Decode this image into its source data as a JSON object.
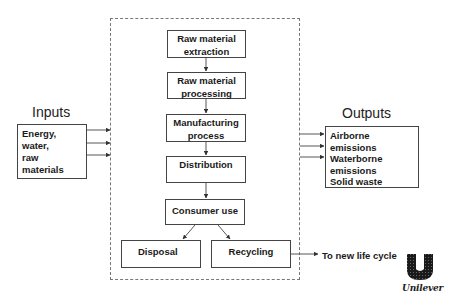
{
  "diagram": {
    "inputs": {
      "heading": "Inputs",
      "items": [
        "Energy,",
        "water,",
        "raw",
        "materials"
      ]
    },
    "outputs": {
      "heading": "Outputs",
      "items": [
        "Airborne",
        "emissions",
        "Waterborne",
        "emissions",
        "Solid waste"
      ]
    },
    "stages": [
      {
        "line1": "Raw material",
        "line2": "extraction"
      },
      {
        "line1": "Raw material",
        "line2": "processing"
      },
      {
        "line1": "Manufacturing",
        "line2": "process"
      },
      {
        "line1": "Distribution",
        "line2": ""
      },
      {
        "line1": "Consumer use",
        "line2": ""
      }
    ],
    "end_of_life": {
      "disposal": "Disposal",
      "recycling": "Recycling"
    },
    "recycling_note": "To new life cycle",
    "logo": {
      "brand": "Unilever",
      "icon": "unilever-u-logo-icon"
    },
    "colors": {
      "line": "#444444",
      "dashed_border": "#777777",
      "text": "#1a1a1a"
    }
  }
}
